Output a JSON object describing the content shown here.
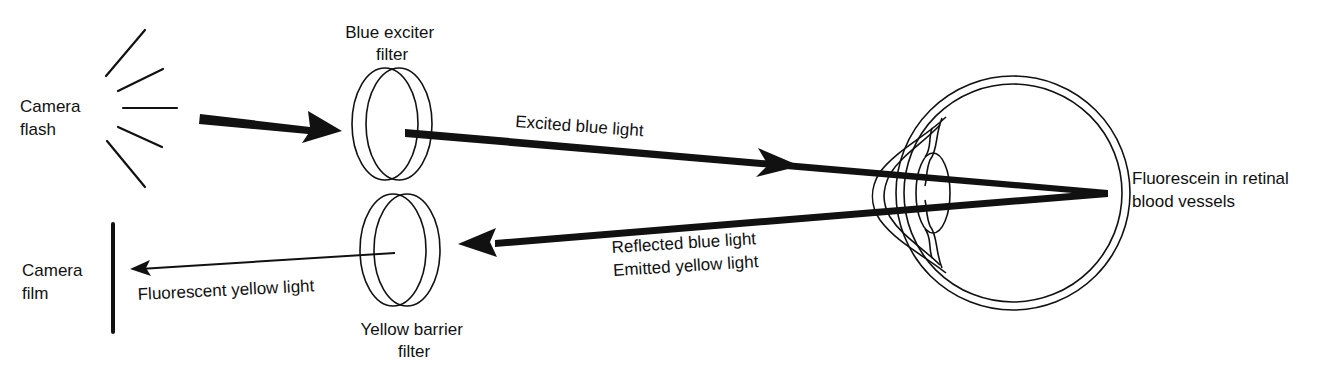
{
  "diagram": {
    "type": "fluorescein-angiography-optical-path",
    "labels": {
      "camera_flash": [
        "Camera",
        "flash"
      ],
      "blue_exciter_filter": [
        "Blue exciter",
        "filter"
      ],
      "excited_blue_light": "Excited blue light",
      "fluorescein": [
        "Fluorescein in retinal",
        "blood vessels"
      ],
      "reflected_emitted": [
        "Reflected blue light",
        "Emitted yellow light"
      ],
      "yellow_barrier_filter": [
        "Yellow barrier",
        "filter"
      ],
      "fluorescent_yellow_light": "Fluorescent yellow light",
      "camera_film": [
        "Camera",
        "film"
      ]
    },
    "colors": {
      "ink": "#111111",
      "background": "#ffffff"
    }
  }
}
